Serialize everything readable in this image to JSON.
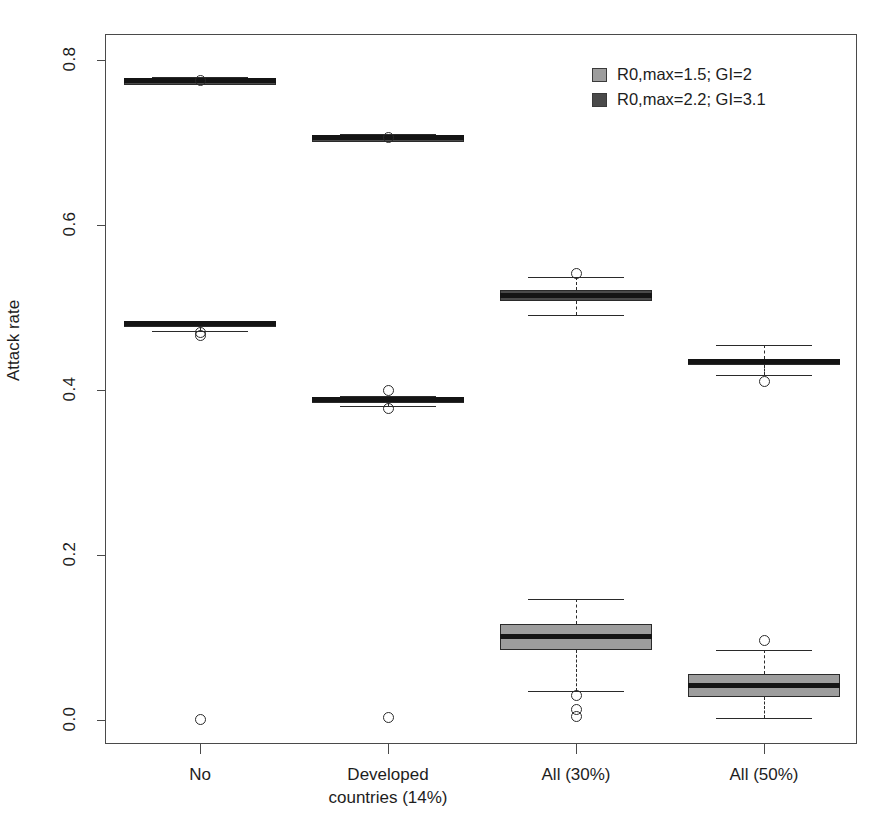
{
  "chart_data": {
    "type": "box",
    "title": "",
    "xlabel": "",
    "ylabel": "Attack rate",
    "ylim": [
      -0.03,
      0.83
    ],
    "yticks": [
      0.0,
      0.2,
      0.4,
      0.6,
      0.8
    ],
    "ytick_labels": [
      "0.0",
      "0.2",
      "0.4",
      "0.6",
      "0.8"
    ],
    "grid": false,
    "legend_position": "top-right",
    "categories": [
      "No",
      "Developed countries (14%)",
      "All (30%)",
      "All (50%)"
    ],
    "category_lines": [
      [
        "No"
      ],
      [
        "Developed",
        "countries (14%)"
      ],
      [
        "All (30%)"
      ],
      [
        "All (50%)"
      ]
    ],
    "series": [
      {
        "name": "R0,max=1.5; GI=2",
        "color": "#9d9d9d",
        "boxes": [
          {
            "category": "No",
            "whisker_low": 0.472,
            "q1": 0.478,
            "median": 0.48,
            "q3": 0.483,
            "whisker_high": 0.484,
            "outliers": [
              0.47,
              0.466,
              0.001
            ]
          },
          {
            "category": "Developed countries (14%)",
            "whisker_low": 0.381,
            "q1": 0.386,
            "median": 0.388,
            "q3": 0.391,
            "whisker_high": 0.393,
            "outliers": [
              0.399,
              0.378,
              0.003
            ]
          },
          {
            "category": "All (30%)",
            "whisker_low": 0.035,
            "q1": 0.085,
            "median": 0.101,
            "q3": 0.116,
            "whisker_high": 0.147,
            "outliers": [
              0.03,
              0.013,
              0.005
            ]
          },
          {
            "category": "All (50%)",
            "whisker_low": 0.003,
            "q1": 0.028,
            "median": 0.042,
            "q3": 0.056,
            "whisker_high": 0.085,
            "outliers": [
              0.096
            ]
          }
        ]
      },
      {
        "name": "R0,max=2.2; GI=3.1",
        "color": "#4a4a4a",
        "boxes": [
          {
            "category": "No",
            "whisker_low": 0.772,
            "q1": 0.774,
            "median": 0.775,
            "q3": 0.777,
            "whisker_high": 0.779,
            "outliers": [
              0.775
            ]
          },
          {
            "category": "Developed countries (14%)",
            "whisker_low": 0.703,
            "q1": 0.705,
            "median": 0.706,
            "q3": 0.708,
            "whisker_high": 0.71,
            "outliers": [
              0.706
            ]
          },
          {
            "category": "All (30%)",
            "whisker_low": 0.491,
            "q1": 0.508,
            "median": 0.515,
            "q3": 0.521,
            "whisker_high": 0.537,
            "outliers": [
              0.541
            ]
          },
          {
            "category": "All (50%)",
            "whisker_low": 0.418,
            "q1": 0.43,
            "median": 0.434,
            "q3": 0.438,
            "whisker_high": 0.455,
            "outliers": [
              0.41
            ]
          }
        ]
      }
    ]
  },
  "legend": {
    "entries": [
      {
        "label": "R0,max=1.5; GI=2",
        "color": "#9d9d9d"
      },
      {
        "label": "R0,max=2.2; GI=3.1",
        "color": "#4a4a4a"
      }
    ]
  },
  "axis": {
    "y_title": "Attack rate"
  },
  "colors": {
    "light_series": "#9d9d9d",
    "dark_series": "#4a4a4a",
    "frame": "#4a4a4a",
    "median": "#141414",
    "background": "#ffffff"
  }
}
